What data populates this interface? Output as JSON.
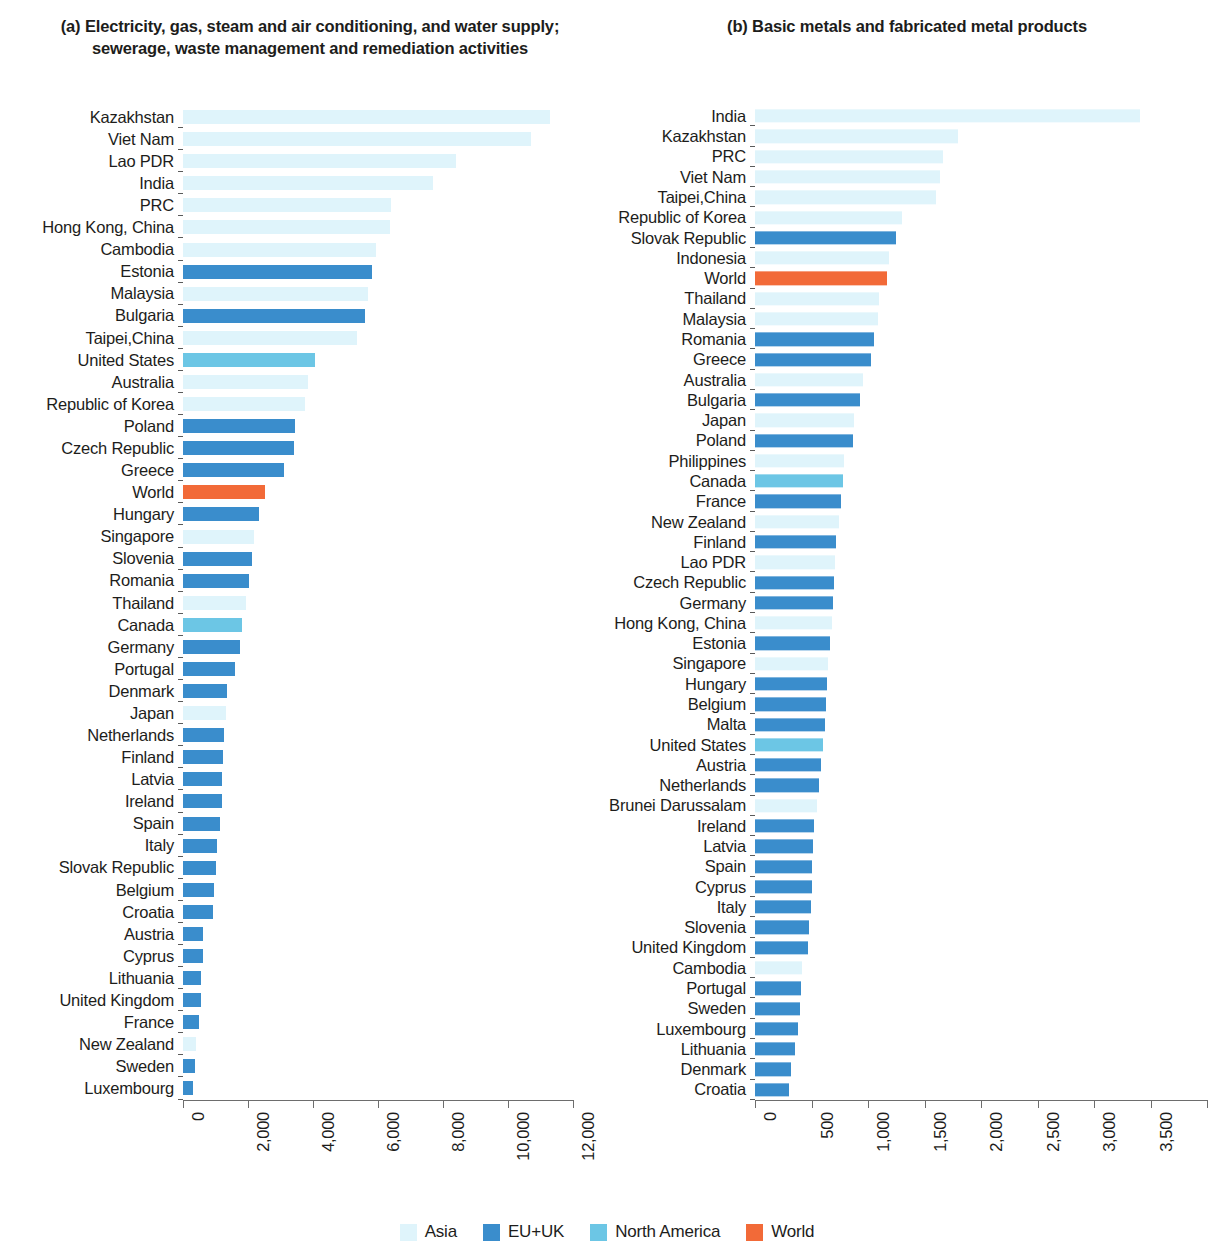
{
  "colors": {
    "asia": "#dff4fb",
    "eu_uk": "#3a8dcc",
    "north_america": "#6cc6e5",
    "world": "#f26a38",
    "axis": "#6d6d6d",
    "text": "#1d1d1b"
  },
  "legend": {
    "items": [
      {
        "label": "Asia",
        "key": "asia"
      },
      {
        "label": "EU+UK",
        "key": "eu_uk"
      },
      {
        "label": "North America",
        "key": "north_america"
      },
      {
        "label": "World",
        "key": "world"
      }
    ]
  },
  "panel_a": {
    "title": "(a) Electricity, gas, steam and air conditioning, and water supply; sewerage, waste management and remediation activities"
  },
  "panel_b": {
    "title": "(b) Basic metals and fabricated metal products"
  },
  "chart_data": [
    {
      "type": "bar",
      "orientation": "horizontal",
      "title": "(a) Electricity, gas, steam and air conditioning, and water supply; sewerage, waste management and remediation activities",
      "xlabel": "",
      "ylabel": "",
      "xlim": [
        0,
        12000
      ],
      "xticks": [
        0,
        2000,
        4000,
        6000,
        8000,
        10000,
        12000
      ],
      "xticklabels": [
        "0",
        "2,000",
        "4,000",
        "6,000",
        "8,000",
        "10,000",
        "12,000"
      ],
      "grid": false,
      "legend_position": "bottom",
      "categories": [
        "Kazakhstan",
        "Viet Nam",
        "Lao PDR",
        "India",
        "PRC",
        "Hong Kong, China",
        "Cambodia",
        "Estonia",
        "Malaysia",
        "Bulgaria",
        "Taipei,China",
        "United States",
        "Australia",
        "Republic of Korea",
        "Poland",
        "Czech Republic",
        "Greece",
        "World",
        "Hungary",
        "Singapore",
        "Slovenia",
        "Romania",
        "Thailand",
        "Canada",
        "Germany",
        "Portugal",
        "Denmark",
        "Japan",
        "Netherlands",
        "Finland",
        "Latvia",
        "Ireland",
        "Spain",
        "Italy",
        "Slovak Republic",
        "Belgium",
        "Croatia",
        "Austria",
        "Cyprus",
        "Lithuania",
        "United Kingdom",
        "France",
        "New Zealand",
        "Sweden",
        "Luxembourg"
      ],
      "values": [
        11280,
        10720,
        8400,
        7700,
        6410,
        6380,
        5930,
        5810,
        5700,
        5590,
        5350,
        4060,
        3860,
        3760,
        3440,
        3430,
        3120,
        2530,
        2330,
        2190,
        2120,
        2040,
        1930,
        1800,
        1740,
        1600,
        1360,
        1310,
        1250,
        1240,
        1210,
        1190,
        1130,
        1040,
        1000,
        960,
        920,
        630,
        600,
        560,
        540,
        500,
        400,
        370,
        310
      ],
      "groups": [
        "asia",
        "asia",
        "asia",
        "asia",
        "asia",
        "asia",
        "asia",
        "eu_uk",
        "asia",
        "eu_uk",
        "asia",
        "north_america",
        "asia",
        "asia",
        "eu_uk",
        "eu_uk",
        "eu_uk",
        "world",
        "eu_uk",
        "asia",
        "eu_uk",
        "eu_uk",
        "asia",
        "north_america",
        "eu_uk",
        "eu_uk",
        "eu_uk",
        "asia",
        "eu_uk",
        "eu_uk",
        "eu_uk",
        "eu_uk",
        "eu_uk",
        "eu_uk",
        "eu_uk",
        "eu_uk",
        "eu_uk",
        "eu_uk",
        "eu_uk",
        "eu_uk",
        "eu_uk",
        "eu_uk",
        "asia",
        "eu_uk",
        "eu_uk"
      ]
    },
    {
      "type": "bar",
      "orientation": "horizontal",
      "title": "(b) Basic metals and fabricated metal products",
      "xlabel": "",
      "ylabel": "",
      "xlim": [
        0,
        4000
      ],
      "xticks": [
        0,
        500,
        1000,
        1500,
        2000,
        2500,
        3000,
        3500,
        4000
      ],
      "xticklabels": [
        "0",
        "500",
        "1,000",
        "1,500",
        "2,000",
        "2,500",
        "3,000",
        "3,500",
        "4,000"
      ],
      "grid": false,
      "legend_position": "bottom",
      "categories": [
        "India",
        "Kazakhstan",
        "PRC",
        "Viet Nam",
        "Taipei,China",
        "Republic of Korea",
        "Slovak Republic",
        "Indonesia",
        "World",
        "Thailand",
        "Malaysia",
        "Romania",
        "Greece",
        "Australia",
        "Bulgaria",
        "Japan",
        "Poland",
        "Philippines",
        "Canada",
        "France",
        "New Zealand",
        "Finland",
        "Lao PDR",
        "Czech Republic",
        "Germany",
        "Hong Kong, China",
        "Estonia",
        "Singapore",
        "Hungary",
        "Belgium",
        "Malta",
        "United States",
        "Austria",
        "Netherlands",
        "Brunei Darussalam",
        "Ireland",
        "Latvia",
        "Spain",
        "Cyprus",
        "Italy",
        "Slovenia",
        "United Kingdom",
        "Cambodia",
        "Portugal",
        "Sweden",
        "Luxembourg",
        "Lithuania",
        "Denmark",
        "Croatia"
      ],
      "values": [
        3410,
        1800,
        1660,
        1640,
        1600,
        1300,
        1250,
        1190,
        1170,
        1100,
        1090,
        1050,
        1030,
        960,
        930,
        880,
        870,
        790,
        780,
        760,
        740,
        720,
        710,
        700,
        690,
        680,
        660,
        650,
        640,
        630,
        620,
        600,
        580,
        570,
        550,
        520,
        510,
        505,
        500,
        495,
        480,
        470,
        420,
        410,
        400,
        380,
        350,
        320,
        300
      ],
      "groups": [
        "asia",
        "asia",
        "asia",
        "asia",
        "asia",
        "asia",
        "eu_uk",
        "asia",
        "world",
        "asia",
        "asia",
        "eu_uk",
        "eu_uk",
        "asia",
        "eu_uk",
        "asia",
        "eu_uk",
        "asia",
        "north_america",
        "eu_uk",
        "asia",
        "eu_uk",
        "asia",
        "eu_uk",
        "eu_uk",
        "asia",
        "eu_uk",
        "asia",
        "eu_uk",
        "eu_uk",
        "eu_uk",
        "north_america",
        "eu_uk",
        "eu_uk",
        "asia",
        "eu_uk",
        "eu_uk",
        "eu_uk",
        "eu_uk",
        "eu_uk",
        "eu_uk",
        "eu_uk",
        "asia",
        "eu_uk",
        "eu_uk",
        "eu_uk",
        "eu_uk",
        "eu_uk",
        "eu_uk"
      ]
    }
  ]
}
